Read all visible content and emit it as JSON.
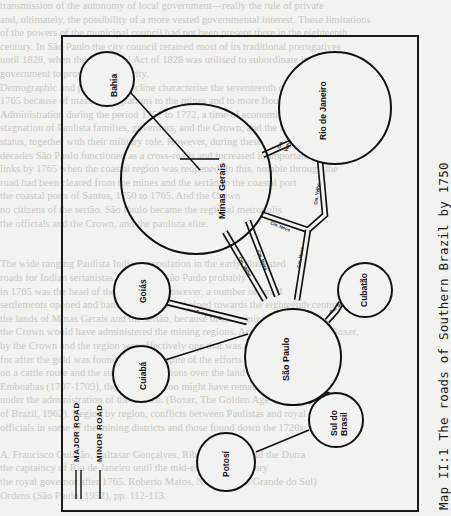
{
  "caption": "Map II:1  The roads of Southern Brazil by 1750",
  "legend": {
    "major_road": "MAJOR ROAD",
    "minor_road": "MINOR ROAD"
  },
  "nodes": {
    "bahia": "Bahia",
    "minas_gerais": "Minas Gerais",
    "rio_de_janeiro": "Rio de Janeiro",
    "goias": "Goiás",
    "sao_paulo": "São Paulo",
    "cubatao": "Cubatão",
    "cuiaba": "Cuiabá",
    "sul_do_brasil_line1": "Sul do",
    "sul_do_brasil_line2": "Brasil",
    "potosi": "Potosí"
  },
  "roads": [
    {
      "from": "Bahia",
      "to": "Minas Gerais",
      "type": "minor"
    },
    {
      "from": "Minas Gerais",
      "to": "Rio de Janeiro",
      "type": "major"
    },
    {
      "from": "Minas Gerais",
      "to": "São Paulo",
      "type": "major"
    },
    {
      "from": "Minas Gerais",
      "to": "São Paulo",
      "type": "major"
    },
    {
      "from": "Rio de Janeiro",
      "to": "São Paulo",
      "type": "major"
    },
    {
      "from": "Goiás",
      "to": "São Paulo",
      "type": "major"
    },
    {
      "from": "Cuiabá",
      "to": "São Paulo",
      "type": "minor"
    },
    {
      "from": "São Paulo",
      "to": "Cubatão",
      "type": "major"
    },
    {
      "from": "São Paulo",
      "to": "Sul do Brasil",
      "type": "major"
    },
    {
      "from": "Potosí",
      "to": "Sul do Brasil",
      "type": "minor"
    }
  ],
  "bleed_text": [
    "transmission of the autonomy of local government—really the rule of private",
    "and, ultimately, the possibility of a more vested governmental interest. These limitations",
    "of the powers of the municipal council had not been present there in the eighteenth",
    "century. In São Paulo the city council retained most of its traditional prerogatives",
    "until 1828, when the additional Act of 1828 was utilised to subordinate local",
    "government to provincial authority.",
    "Demographic and population decline characterise the seventeenth century",
    "1765 because of massive migrations to the mines and to more flourishing areas.",
    "Administration during the period 1752 to 1772, a time of economic and community",
    "stagnation of Paulista families, governors, and the Crown, and the loss of",
    "status, together with their military role. However, during these",
    "decades São Paulo functioned as a cross-roads and increased in importance to",
    "links by 1765 when the coastal region was reopened. In this, notable through the",
    "road had been cleared from the mines and the sertão to the coastal port",
    "the coastal ports of Santos, 1750 to 1765. And the Crown",
    "no citizens of the sertão. São Paulo became the regional metropolis",
    "the officials and the Crown, and the paulista elite.",
    "",
    "",
    "The wide ranging Paulista Indians population in the early illustrated",
    "roads for Indian sertanistas, the city of São Paulo probably",
    "in 1765 was the head of the captaincy. However, a number of small",
    "settlements opened and bandeirante traders helped towards the eighteenth century",
    "the lands of Minas Gerais and the sertão, because of the mining districts",
    "the Crown would have administered the mining regions. According to Charles Boxer,",
    "by the Crown and the region was effectively one that was no longer than",
    "for after the gold was found. In fact, in spite of the efforts of Paulistas",
    "on a cattle route and the surrounding regions over the land settled in the war of",
    "Emboabas (1707-1709), the mining region might have remained",
    "under the administration of the Crown. (Boxer, The Golden Age",
    "of Brazil, 1962). Region by region, conflicts between Paulistas and royal",
    "officials in some of the mining districts and those found down the 1720s",
    "",
    "A. Francisco Quintão, Baltasar Gonçalves, Ribeirão Preto, and the Dutra",
    "the captaincy of Rio de Janeiro until the mid-eighteenth century",
    "the royal governor after 1765. Roberto Matos, Nelson, (Rio Grande do Sul)",
    "Ordens (São Paulo, 1952), pp. 112-113."
  ]
}
